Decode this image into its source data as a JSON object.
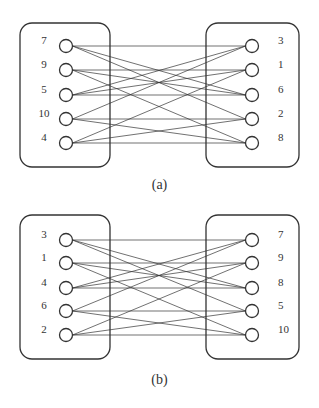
{
  "panels": [
    {
      "id": "a",
      "caption": "(a)",
      "left_labels": [
        "7",
        "9",
        "5",
        "10",
        "4"
      ],
      "right_labels": [
        "3",
        "1",
        "6",
        "2",
        "8"
      ],
      "node_y": [
        46,
        70,
        95,
        119,
        143
      ],
      "box_top": 23,
      "box_bottom": 167,
      "caption_y": 186,
      "edges": [
        [
          0,
          0
        ],
        [
          0,
          2
        ],
        [
          0,
          3
        ],
        [
          1,
          1
        ],
        [
          1,
          2
        ],
        [
          1,
          4
        ],
        [
          2,
          0
        ],
        [
          2,
          1
        ],
        [
          2,
          2
        ],
        [
          3,
          0
        ],
        [
          3,
          3
        ],
        [
          3,
          4
        ],
        [
          4,
          1
        ],
        [
          4,
          3
        ],
        [
          4,
          4
        ]
      ]
    },
    {
      "id": "b",
      "caption": "(b)",
      "left_labels": [
        "3",
        "1",
        "4",
        "6",
        "2"
      ],
      "right_labels": [
        "7",
        "9",
        "8",
        "5",
        "10"
      ],
      "node_y": [
        240,
        263,
        288,
        311,
        335
      ],
      "box_top": 215,
      "box_bottom": 359,
      "caption_y": 381,
      "edges": [
        [
          0,
          0
        ],
        [
          0,
          2
        ],
        [
          0,
          3
        ],
        [
          1,
          1
        ],
        [
          1,
          2
        ],
        [
          1,
          4
        ],
        [
          2,
          0
        ],
        [
          2,
          1
        ],
        [
          2,
          2
        ],
        [
          3,
          0
        ],
        [
          3,
          3
        ],
        [
          3,
          4
        ],
        [
          4,
          1
        ],
        [
          4,
          3
        ],
        [
          4,
          4
        ]
      ]
    }
  ],
  "layout": {
    "left_box_x": [
      20,
      110
    ],
    "right_box_x": [
      206,
      299
    ],
    "left_node_x": 66,
    "right_node_x": 252,
    "left_label_x": 44,
    "right_label_x": 278,
    "node_radius": 6.5,
    "stroke_color": "#333333"
  }
}
